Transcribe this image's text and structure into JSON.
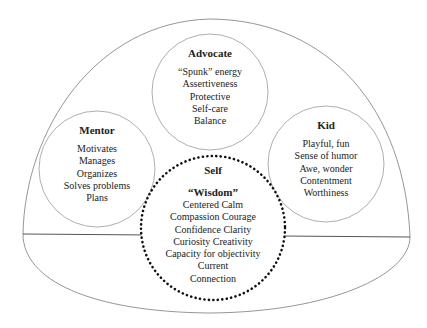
{
  "diagram": {
    "colors": {
      "line": "#8a8a8a",
      "dark_line": "#555555",
      "dots": "#111111",
      "text": "#222222"
    },
    "parts": {
      "advocate": {
        "title": "Advocate",
        "items": [
          "“Spunk” energy",
          "Assertiveness",
          "Protective",
          "Self-care",
          "Balance"
        ]
      },
      "mentor": {
        "title": "Mentor",
        "items": [
          "Motivates",
          "Manages",
          "Organizes",
          "Solves problems",
          "Plans"
        ]
      },
      "kid": {
        "title": "Kid",
        "items": [
          "Playful, fun",
          "Sense of humor",
          "Awe, wonder",
          "Contentment",
          "Worthiness"
        ]
      },
      "self": {
        "title": "Self",
        "subtitle": "“Wisdom”",
        "items": [
          "Centered Calm",
          "Compassion Courage",
          "Confidence Clarity",
          "Curiosity Creativity",
          "Capacity for objectivity",
          "Current",
          "Connection"
        ]
      }
    }
  }
}
